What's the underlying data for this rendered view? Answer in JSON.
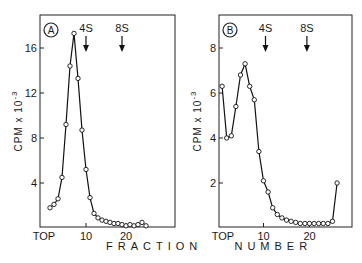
{
  "figure": {
    "x_axis_title": "FRACTION    NUMBER"
  },
  "chart_data": [
    {
      "type": "line",
      "panel": "A",
      "title": "",
      "xlabel": "FRACTION NUMBER",
      "ylabel": "CPM x 10^-3",
      "ylabel_parts": {
        "main": "CPM  x  10",
        "exp": "-3"
      },
      "x_tick_labels": [
        "TOP",
        "10",
        "20"
      ],
      "x_ticks": [
        0,
        10,
        20
      ],
      "y_ticks": [
        4,
        8,
        12,
        16
      ],
      "y_tick_labels": [
        "4",
        "8",
        "12",
        "16"
      ],
      "xlim": [
        0,
        32
      ],
      "ylim": [
        0,
        18
      ],
      "grid": false,
      "markers": [
        {
          "label": "4S",
          "fraction": 10
        },
        {
          "label": "8S",
          "fraction": 19
        }
      ],
      "x": [
        1,
        2,
        3,
        4,
        5,
        6,
        7,
        8,
        9,
        10,
        11,
        12,
        13,
        14,
        15,
        16,
        17,
        18,
        19,
        20,
        21,
        22,
        23,
        24,
        25
      ],
      "values": [
        1.8,
        2.1,
        2.6,
        4.5,
        9.2,
        14.4,
        17.3,
        13.3,
        8.7,
        5.2,
        2.7,
        1.3,
        0.9,
        0.7,
        0.6,
        0.5,
        0.4,
        0.4,
        0.3,
        0.2,
        0.3,
        0.2,
        0.3,
        0.5,
        0.2
      ]
    },
    {
      "type": "line",
      "panel": "B",
      "title": "",
      "xlabel": "FRACTION NUMBER",
      "ylabel": "CPM x 10^-3",
      "ylabel_parts": {
        "main": "CPM  x  10",
        "exp": "-3"
      },
      "x_tick_labels": [
        "TOP",
        "10",
        "20"
      ],
      "x_ticks": [
        0,
        10,
        20
      ],
      "y_ticks": [
        2,
        4,
        6,
        8
      ],
      "y_tick_labels": [
        "2",
        "4",
        "6",
        "8"
      ],
      "xlim": [
        0,
        29
      ],
      "ylim": [
        0,
        9
      ],
      "grid": false,
      "markers": [
        {
          "label": "4S",
          "fraction": 10
        },
        {
          "label": "8S",
          "fraction": 19
        }
      ],
      "x": [
        1,
        2,
        3,
        4,
        5,
        6,
        7,
        8,
        9,
        10,
        11,
        12,
        13,
        14,
        15,
        16,
        17,
        18,
        19,
        20,
        21,
        22,
        23,
        24,
        25,
        26
      ],
      "values": [
        6.3,
        4.0,
        4.1,
        5.4,
        6.8,
        7.3,
        6.3,
        5.7,
        3.4,
        2.1,
        1.6,
        0.9,
        0.6,
        0.45,
        0.35,
        0.3,
        0.25,
        0.2,
        0.2,
        0.2,
        0.2,
        0.2,
        0.2,
        0.2,
        0.3,
        2.0
      ]
    }
  ]
}
